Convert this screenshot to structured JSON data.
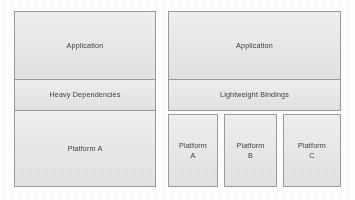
{
  "diagram": {
    "type": "architecture-comparison",
    "background_color": "#ffffff",
    "box_fill_color": "#ebe9e9",
    "box_border_color": "#9b9b9b",
    "text_color": "#3d3d3d",
    "left": {
      "name": "monolithic-stack",
      "layers": [
        {
          "id": "application",
          "label": "Application"
        },
        {
          "id": "heavy-dependencies",
          "label": "Heavy Dependencies"
        },
        {
          "id": "platform-a",
          "label": "Platform A"
        }
      ]
    },
    "right": {
      "name": "portable-stack",
      "layers": [
        {
          "id": "application",
          "label": "Application"
        },
        {
          "id": "lightweight-bindings",
          "label": "Lightweight Bindings"
        }
      ],
      "platforms": [
        {
          "id": "platform-a",
          "label": "Platform\nA"
        },
        {
          "id": "platform-b",
          "label": "Platform\nB"
        },
        {
          "id": "platform-c",
          "label": "Platform\nC"
        }
      ]
    }
  }
}
